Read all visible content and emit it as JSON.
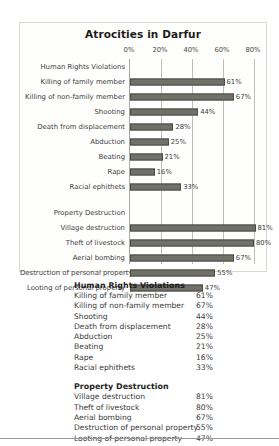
{
  "chart_data": {
    "type": "bar",
    "orientation": "horizontal",
    "title": "Atrocities in Darfur",
    "xlabel": "",
    "ylabel": "",
    "xlim": [
      0,
      80
    ],
    "grid": true,
    "legend": "none",
    "tick_labels": [
      "0%",
      "20%",
      "40%",
      "60%",
      "80%"
    ],
    "tick_values": [
      0,
      20,
      40,
      60,
      80
    ],
    "categories": [
      "Human Rights Violations",
      "Killing of family member",
      "Killing of non-family member",
      "Shooting",
      "Death from displacement",
      "Abduction",
      "Beating",
      "Rape",
      "Racial ephithets",
      "",
      "Property Destruction",
      "Village destruction",
      "Theft of livestock",
      "Aerial bombing",
      "Destruction of personal property",
      "Looting of personal property"
    ],
    "values": [
      null,
      61,
      67,
      44,
      28,
      25,
      21,
      16,
      33,
      null,
      null,
      81,
      80,
      67,
      55,
      47
    ],
    "data_labels": [
      "",
      "61%",
      "67%",
      "44%",
      "28%",
      "25%",
      "21%",
      "16%",
      "33%",
      "",
      "",
      "81%",
      "80%",
      "67%",
      "55%",
      "47%"
    ],
    "bar_color": "#71716a",
    "bar_border_color": "#4a4a45"
  },
  "chart": {
    "title": "Atrocities in Darfur",
    "ticks": [
      {
        "label": "0%",
        "value": 0
      },
      {
        "label": "20%",
        "value": 20
      },
      {
        "label": "40%",
        "value": 40
      },
      {
        "label": "60%",
        "value": 60
      },
      {
        "label": "80%",
        "value": 80
      }
    ],
    "rows": [
      {
        "label": "Human Rights Violations",
        "value": null,
        "display": "",
        "type": "group"
      },
      {
        "label": "Killing of family member",
        "value": 61,
        "display": "61%",
        "type": "bar"
      },
      {
        "label": "Killing of non-family member",
        "value": 67,
        "display": "67%",
        "type": "bar"
      },
      {
        "label": "Shooting",
        "value": 44,
        "display": "44%",
        "type": "bar"
      },
      {
        "label": "Death from displacement",
        "value": 28,
        "display": "28%",
        "type": "bar"
      },
      {
        "label": "Abduction",
        "value": 25,
        "display": "25%",
        "type": "bar"
      },
      {
        "label": "Beating",
        "value": 21,
        "display": "21%",
        "type": "bar"
      },
      {
        "label": "Rape",
        "value": 16,
        "display": "16%",
        "type": "bar"
      },
      {
        "label": "Racial ephithets",
        "value": 33,
        "display": "33%",
        "type": "bar"
      },
      {
        "label": "",
        "value": null,
        "display": "",
        "type": "spacer"
      },
      {
        "label": "Property Destruction",
        "value": null,
        "display": "",
        "type": "group"
      },
      {
        "label": "Village destruction",
        "value": 81,
        "display": "81%",
        "type": "bar"
      },
      {
        "label": "Theft of livestock",
        "value": 80,
        "display": "80%",
        "type": "bar"
      },
      {
        "label": "Aerial bombing",
        "value": 67,
        "display": "67%",
        "type": "bar"
      },
      {
        "label": "Destruction of personal property",
        "value": 55,
        "display": "55%",
        "type": "bar"
      },
      {
        "label": "Looting of personal property",
        "value": 47,
        "display": "47%",
        "type": "bar"
      }
    ]
  },
  "table": {
    "groups": [
      {
        "title": "Human Rights Violations",
        "rows": [
          {
            "label": "Killing of family member",
            "value": "61%"
          },
          {
            "label": "Killing of non-family member",
            "value": "67%"
          },
          {
            "label": "Shooting",
            "value": "44%"
          },
          {
            "label": "Death from displacement",
            "value": "28%"
          },
          {
            "label": "Abduction",
            "value": "25%"
          },
          {
            "label": "Beating",
            "value": "21%"
          },
          {
            "label": "Rape",
            "value": "16%"
          },
          {
            "label": "Racial ephithets",
            "value": "33%"
          }
        ]
      },
      {
        "title": "Property Destruction",
        "rows": [
          {
            "label": "Village destruction",
            "value": "81%"
          },
          {
            "label": "Theft of livestock",
            "value": "80%"
          },
          {
            "label": "Aerial bombing",
            "value": "67%"
          },
          {
            "label": "Destruction of personal property",
            "value": "55%"
          },
          {
            "label": "Looting of personal property",
            "value": "47%"
          }
        ]
      }
    ]
  }
}
